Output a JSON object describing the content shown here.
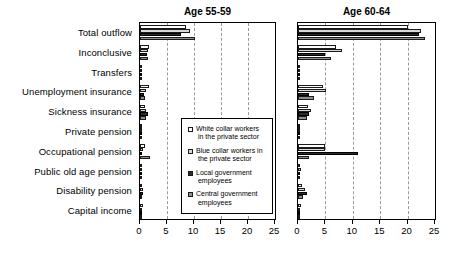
{
  "chart_data": {
    "type": "bar",
    "orientation": "horizontal",
    "title": "",
    "xlabel": "",
    "ylabel": "",
    "xlim": [
      0,
      25
    ],
    "xticks": [
      0,
      5,
      10,
      15,
      20,
      25
    ],
    "grid": true,
    "legend_position": "inside-lower-right-of-left-panel",
    "categories": [
      "Total outflow",
      "Inconclusive",
      "Transfers",
      "Unemployment insurance",
      "Sickness insurance",
      "Private pension",
      "Occupational pension",
      "Public old age pension",
      "Disability pension",
      "Capital income"
    ],
    "series_names": [
      "White collar workers in the private sector",
      "Blue collar workers in the private sector",
      "Local government employees",
      "Central government employees"
    ],
    "panels": [
      {
        "title": "Age 55-59",
        "series": [
          {
            "name": "White collar workers in the private sector",
            "values": [
              8.6,
              1.6,
              0.0,
              1.7,
              1.0,
              0.1,
              0.9,
              0.1,
              0.4,
              0.5
            ]
          },
          {
            "name": "Blue collar workers in the private sector",
            "values": [
              9.3,
              1.5,
              0.0,
              1.1,
              1.2,
              0.1,
              0.5,
              0.1,
              0.5,
              0.3
            ]
          },
          {
            "name": "Local government employees",
            "values": [
              7.6,
              1.3,
              0.0,
              0.7,
              1.4,
              0.1,
              0.4,
              0.1,
              0.6,
              0.2
            ]
          },
          {
            "name": "Central government employees",
            "values": [
              10.2,
              1.5,
              0.0,
              1.0,
              1.1,
              0.1,
              1.9,
              0.1,
              0.4,
              0.3
            ]
          }
        ]
      },
      {
        "title": "Age 60-64",
        "series": [
          {
            "name": "White collar workers in the private sector",
            "values": [
              20.0,
              7.0,
              0.1,
              4.6,
              1.8,
              0.2,
              5.0,
              0.4,
              0.8,
              0.6
            ]
          },
          {
            "name": "Blue collar workers in the private sector",
            "values": [
              22.5,
              8.0,
              0.1,
              5.1,
              2.3,
              0.2,
              5.0,
              0.5,
              1.2,
              0.4
            ]
          },
          {
            "name": "Local government employees",
            "values": [
              22.0,
              5.0,
              0.1,
              2.0,
              2.0,
              0.1,
              11.0,
              0.4,
              1.6,
              0.3
            ]
          },
          {
            "name": "Central government employees",
            "values": [
              23.2,
              6.0,
              0.1,
              3.0,
              1.6,
              0.1,
              2.0,
              0.3,
              0.9,
              0.3
            ]
          }
        ]
      }
    ],
    "legend": [
      {
        "label_line1": "White collar workers",
        "label_line2": "in the private sector",
        "fill": "#ffffff"
      },
      {
        "label_line1": "Blue collar workers in",
        "label_line2": "the private sector",
        "fill": "#d8d8d8"
      },
      {
        "label_line1": "Local government",
        "label_line2": "employees",
        "fill": "#2b2b2b"
      },
      {
        "label_line1": "Central government",
        "label_line2": "employees",
        "fill": "#8e8e8e"
      }
    ]
  }
}
